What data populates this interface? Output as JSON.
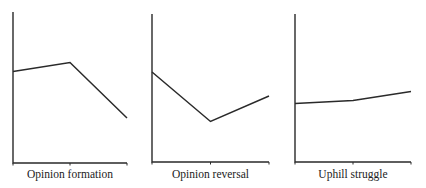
{
  "chart_data": [
    {
      "type": "line",
      "title": "",
      "xlabel": "Opinion formation",
      "ylabel": "",
      "categories": [
        "t0",
        "t1",
        "t2"
      ],
      "x": [
        0,
        1,
        2
      ],
      "values": [
        61,
        67,
        30
      ],
      "ylim": [
        0,
        100
      ],
      "grid": false,
      "tick_labels": false
    },
    {
      "type": "line",
      "title": "",
      "xlabel": "Opinion reversal",
      "ylabel": "",
      "categories": [
        "t0",
        "t1",
        "t2"
      ],
      "x": [
        0,
        1,
        2
      ],
      "values": [
        60,
        27,
        44
      ],
      "ylim": [
        0,
        100
      ],
      "grid": false,
      "tick_labels": false
    },
    {
      "type": "line",
      "title": "",
      "xlabel": "Uphill struggle",
      "ylabel": "",
      "categories": [
        "t0",
        "t1",
        "t2"
      ],
      "x": [
        0,
        1,
        2
      ],
      "values": [
        39,
        41,
        47
      ],
      "ylim": [
        0,
        100
      ],
      "grid": false,
      "tick_labels": false
    }
  ],
  "panels": [
    {
      "label": "Opinion formation"
    },
    {
      "label": "Opinion reversal"
    },
    {
      "label": "Uphill struggle"
    }
  ],
  "colors": {
    "line": "#2a2a2a",
    "background": "#ffffff"
  }
}
